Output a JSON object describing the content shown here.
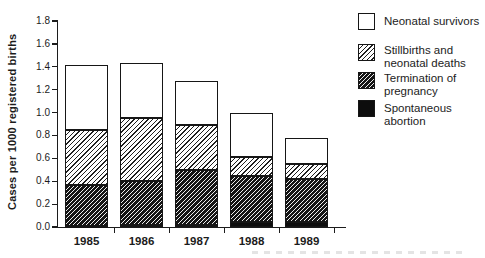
{
  "figure": {
    "background": "#ffffff",
    "ink_color": "#1a1a1a",
    "ylabel": "Cases per 1000 registered births"
  },
  "chart_data": {
    "type": "bar",
    "stacked": true,
    "title": "",
    "xlabel": "",
    "ylabel": "Cases per 1000 registered births",
    "ylim": [
      0,
      1.8
    ],
    "ytick_step": 0.2,
    "ytick_labels": [
      "0.0",
      "0.2",
      "0.4",
      "0.6",
      "0.8",
      "1.0",
      "1.2",
      "1.4",
      "1.6",
      "1.8"
    ],
    "grid": false,
    "categories": [
      "1985",
      "1986",
      "1987",
      "1988",
      "1989"
    ],
    "series": [
      {
        "name": "Spontaneous abortion",
        "pattern": "solid-black",
        "values": [
          0.01,
          0.02,
          0.02,
          0.04,
          0.04
        ]
      },
      {
        "name": "Termination of pregnancy",
        "pattern": "dense-hatch",
        "values": [
          0.36,
          0.38,
          0.48,
          0.41,
          0.38
        ]
      },
      {
        "name": "Stillbirths and neonatal deaths",
        "pattern": "light-hatch",
        "values": [
          0.48,
          0.55,
          0.39,
          0.16,
          0.13
        ]
      },
      {
        "name": "Neonatal survivors",
        "pattern": "white",
        "values": [
          0.57,
          0.48,
          0.39,
          0.39,
          0.23
        ]
      }
    ],
    "totals": [
      1.42,
      1.43,
      1.28,
      1.0,
      0.78
    ],
    "legend": {
      "position": "top-right",
      "items": [
        {
          "pattern": "white",
          "lines": [
            "Neonatal survivors"
          ]
        },
        {
          "pattern": "light-hatch",
          "lines": [
            "Stillbirths and",
            "neonatal deaths"
          ]
        },
        {
          "pattern": "dense-hatch",
          "lines": [
            "Termination of",
            "pregnancy"
          ]
        },
        {
          "pattern": "solid-black",
          "lines": [
            "Spontaneous abortion"
          ]
        }
      ]
    }
  }
}
